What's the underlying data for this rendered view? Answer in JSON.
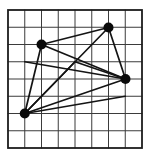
{
  "diagram": {
    "width": 150,
    "height": 156,
    "background_color": "#ffffff",
    "grid": {
      "x0": 8,
      "y0": 10,
      "x1": 142,
      "y1": 148,
      "cols": 8,
      "rows": 8,
      "line_color": "#3b3b3b",
      "line_width": 1,
      "border_color": "#1c1c1c",
      "border_width": 1.8
    },
    "points": {
      "A": {
        "x": 41.5,
        "y": 44.5,
        "dot": true,
        "grid_col": 2,
        "grid_row": 2
      },
      "B": {
        "x": 108.5,
        "y": 27.5,
        "dot": true,
        "grid_col": 6,
        "grid_row": 1
      },
      "C": {
        "x": 125.5,
        "y": 79,
        "dot": true,
        "grid_col": 7,
        "grid_row": 4
      },
      "D": {
        "x": 24.75,
        "y": 113.5,
        "dot": true,
        "grid_col": 1,
        "grid_row": 6
      },
      "P": {
        "x": 75,
        "y": 61.75,
        "dot": false,
        "grid_col": 4,
        "grid_row": 3
      },
      "Q1": {
        "x": 24.75,
        "y": 61.75,
        "dot": false,
        "grid_col": 1,
        "grid_row": 3
      },
      "Q2": {
        "x": 125.25,
        "y": 96.25,
        "dot": false,
        "grid_col": 7,
        "grid_row": 5
      }
    },
    "edges": [
      [
        "A",
        "B"
      ],
      [
        "B",
        "C"
      ],
      [
        "C",
        "D"
      ],
      [
        "D",
        "A"
      ],
      [
        "A",
        "C"
      ],
      [
        "B",
        "D"
      ],
      [
        "D",
        "P"
      ],
      [
        "P",
        "C"
      ],
      [
        "Q1",
        "C"
      ],
      [
        "D",
        "Q2"
      ]
    ],
    "edge_color": "#141414",
    "edge_width": 1.7,
    "dot_radius": 5,
    "dot_color": "#0a0a0a"
  }
}
